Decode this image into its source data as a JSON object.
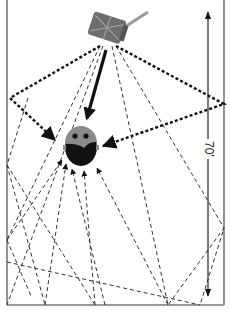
{
  "diagram": {
    "dimension_label": "70'",
    "elements": {
      "speaker": "speaker-icon",
      "listener": "listener-head-icon",
      "direct_path": "direct sound arrow",
      "early_reflections": "bold dotted reflection paths",
      "late_reflections": "thin dashed reflection paths"
    },
    "colors": {
      "frame": "#777777",
      "lines": "#222222",
      "speaker_body": "#6e6e6e",
      "speaker_stripe": "#a8a8a8",
      "head_top": "#8a8a8a",
      "head_face": "#111111"
    }
  }
}
